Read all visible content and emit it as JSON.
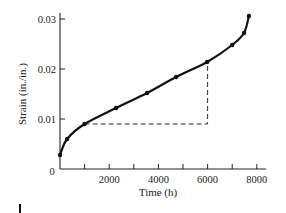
{
  "chart_data": {
    "type": "line",
    "title": "",
    "xlabel": "Time (h)",
    "ylabel": "Strain (in./in.)",
    "xlim": [
      0,
      8300
    ],
    "ylim": [
      0,
      0.031
    ],
    "x_ticks": [
      0,
      1000,
      2000,
      3000,
      4000,
      5000,
      6000,
      7000,
      8000
    ],
    "x_tick_labels": [
      "0",
      "",
      "2000",
      "",
      "4000",
      "",
      "6000",
      "",
      "8000"
    ],
    "y_ticks": [
      0.01,
      0.02,
      0.03
    ],
    "y_tick_labels": [
      "0.01",
      "0.02",
      "0.03"
    ],
    "origin_label": "0",
    "grid": false,
    "legend": null,
    "series": [
      {
        "name": "creep curve",
        "color": "#111111",
        "x": [
          0,
          290,
          1000,
          2280,
          3540,
          4720,
          5980,
          7000,
          7480,
          7680
        ],
        "y": [
          0.0028,
          0.006,
          0.009,
          0.0122,
          0.0152,
          0.0184,
          0.0214,
          0.0248,
          0.0272,
          0.0306
        ]
      }
    ],
    "annotations": [
      {
        "type": "dashed-triangle",
        "description": "Slope construction for secondary (steady-state) creep rate",
        "points": [
          [
            1000,
            0.009
          ],
          [
            6000,
            0.009
          ],
          [
            6000,
            0.0214
          ]
        ],
        "color": "#333333"
      }
    ]
  }
}
